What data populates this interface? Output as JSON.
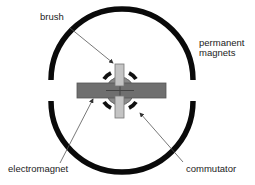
{
  "diagram": {
    "labels": {
      "brush": "brush",
      "permanent_magnets_line1": "permanent",
      "permanent_magnets_line2": "magnets",
      "electromagnet": "electromagnet",
      "commutator": "commutator"
    },
    "colors": {
      "magnet": "#0a0a0a",
      "electromagnet": "#6f6f6f",
      "commutator_core": "#8a8a8a",
      "brush": "#c4c4c4",
      "arrow": "#555555"
    }
  }
}
